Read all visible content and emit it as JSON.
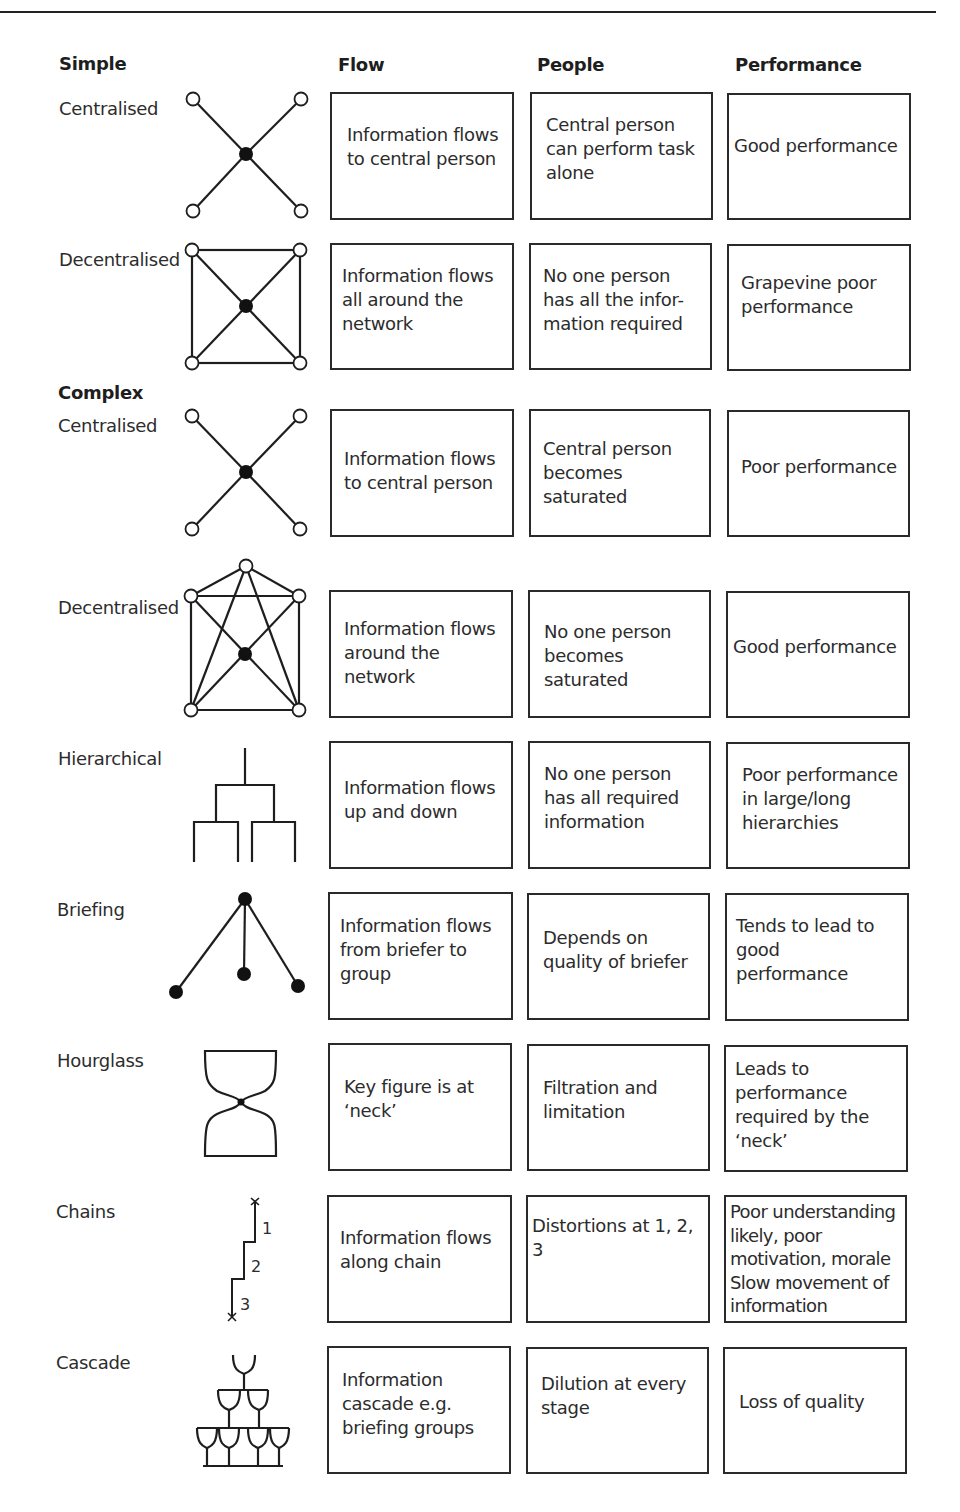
{
  "headers": {
    "section_simple": "Simple",
    "section_complex": "Complex",
    "col_flow": "Flow",
    "col_people": "People",
    "col_performance": "Performance"
  },
  "rows": [
    {
      "group": "Simple",
      "label": "Centralised",
      "icon": "star-network-icon",
      "flow": "Information flows\nto central person",
      "people": "Central person\ncan perform task\nalone",
      "performance": "Good performance"
    },
    {
      "group": "Simple",
      "label": "Decentralised",
      "icon": "square-network-icon",
      "flow": "Information flows\nall around the\nnetwork",
      "people": "No one person\nhas all the infor-\nmation required",
      "performance": "Grapevine poor\nperformance"
    },
    {
      "group": "Complex",
      "label": "Centralised",
      "icon": "star-network-icon",
      "flow": "Information flows\nto central person",
      "people": "Central person\nbecomes\nsaturated",
      "performance": "Poor performance"
    },
    {
      "group": "Complex",
      "label": "Decentralised",
      "icon": "pentagon-network-icon",
      "flow": "Information flows\naround the\nnetwork",
      "people": "No one person\nbecomes\nsaturated",
      "performance": "Good performance"
    },
    {
      "group": "Complex",
      "label": "Hierarchical",
      "icon": "hierarchy-tree-icon",
      "flow": "Information flows\nup and down",
      "people": "No one person\nhas all required\ninformation",
      "performance": "Poor performance\nin large/long\nhierarchies"
    },
    {
      "group": "Complex",
      "label": "Briefing",
      "icon": "briefing-fan-icon",
      "flow": "Information flows\nfrom briefer to\ngroup",
      "people": "Depends on\nquality of briefer",
      "performance": "Tends to lead to\ngood performance"
    },
    {
      "group": "Complex",
      "label": "Hourglass",
      "icon": "hourglass-icon",
      "flow": "Key figure is at\n‘neck’",
      "people": "Filtration and\nlimitation",
      "performance": "Leads to\nperformance\nrequired by the\n‘neck’"
    },
    {
      "group": "Complex",
      "label": "Chains",
      "icon": "chain-steps-icon",
      "chain_step_labels": [
        "1",
        "2",
        "3"
      ],
      "flow": "Information flows\nalong chain",
      "people": "Distortions at 1, 2, 3",
      "performance": "Poor understanding\nlikely, poor\nmotivation, morale\nSlow movement of\ninformation"
    },
    {
      "group": "Complex",
      "label": "Cascade",
      "icon": "glass-cascade-icon",
      "flow": "Information\ncascade e.g.\nbriefing groups",
      "people": "Dilution at every\nstage",
      "performance": "Loss of quality"
    }
  ]
}
